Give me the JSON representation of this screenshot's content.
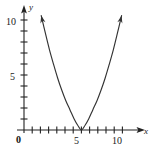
{
  "figure": {
    "background": "#ffffff",
    "width": 153,
    "height": 158
  },
  "labels": {
    "y_axis_name": "y",
    "x_axis_name": "x",
    "origin": "0",
    "y_tick_10": "10",
    "y_tick_5": "5",
    "x_tick_5": "5",
    "x_tick_10": "10"
  },
  "chart_data": {
    "type": "line",
    "title": "",
    "xlabel": "x",
    "ylabel": "y",
    "xlim": [
      0,
      12.5
    ],
    "ylim": [
      0,
      11.5
    ],
    "grid": false,
    "legend": false,
    "axis_arrows": {
      "x": "right",
      "y": "up"
    },
    "x_ticks": [
      1,
      2,
      3,
      4,
      5,
      6,
      7,
      8,
      9,
      10,
      11
    ],
    "x_tick_labels": {
      "5": "5",
      "10": "10"
    },
    "y_ticks": [
      1,
      2,
      3,
      4,
      5,
      6,
      7,
      8,
      9,
      10,
      11
    ],
    "y_tick_labels": {
      "5": "5",
      "10": "10"
    },
    "origin_label": "0",
    "curve": {
      "name": "parabola",
      "equation": "y = 0.45(x - 7)^2",
      "vertex": [
        7,
        0
      ],
      "opens": "up",
      "leading_coefficient": 0.45,
      "color": "#333333",
      "line_width": 1.1,
      "arrowheads": [
        "start",
        "end"
      ],
      "x_domain": [
        2.1,
        11.9
      ],
      "points": [
        [
          2.1,
          10.4
        ],
        [
          2.6,
          8.82
        ],
        [
          3.1,
          7.31
        ],
        [
          3.6,
          5.98
        ],
        [
          4.1,
          4.73
        ],
        [
          4.6,
          3.63
        ],
        [
          5.1,
          2.66
        ],
        [
          5.6,
          1.85
        ],
        [
          6.1,
          1.03
        ],
        [
          6.55,
          0.43
        ],
        [
          7.0,
          0.0
        ],
        [
          7.45,
          0.43
        ],
        [
          7.9,
          1.03
        ],
        [
          8.4,
          1.85
        ],
        [
          8.9,
          2.66
        ],
        [
          9.4,
          3.63
        ],
        [
          9.9,
          4.73
        ],
        [
          10.4,
          5.98
        ],
        [
          10.9,
          7.31
        ],
        [
          11.4,
          8.82
        ],
        [
          11.9,
          10.4
        ]
      ]
    }
  }
}
